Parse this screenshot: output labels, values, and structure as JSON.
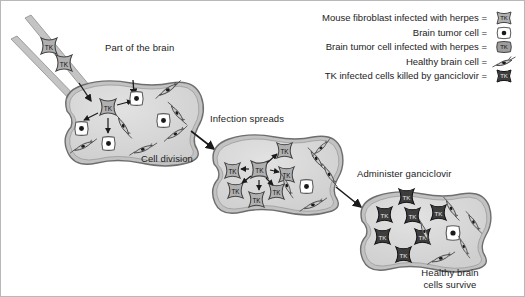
{
  "figure": {
    "background_color": "#ffffff",
    "border_color": "#b8b8b8"
  },
  "legend": {
    "items": [
      {
        "label": "Mouse fibroblast infected with herpes =",
        "icon": "tk-fibroblast-icon",
        "icon_type": "tk-star",
        "fill": "#b4b4b4",
        "text": "TK"
      },
      {
        "label": "Brain tumor cell =",
        "icon": "tumor-cell-icon",
        "icon_type": "tumor-blob",
        "fill": "#ffffff",
        "text": ""
      },
      {
        "label": "Brain tumor cell infected with herpes =",
        "icon": "tk-tumor-cell-icon",
        "icon_type": "tk-square",
        "fill": "#9a9a9a",
        "text": "TK"
      },
      {
        "label": "Healthy brain cell =",
        "icon": "healthy-neuron-icon",
        "icon_type": "neuron-spindle",
        "fill": "#c9c9c9",
        "text": ""
      },
      {
        "label": "TK infected cells killed by ganciclovir =",
        "icon": "killed-cell-icon",
        "icon_type": "tk-star-dark",
        "fill": "#3a3a3a",
        "text": "TK"
      }
    ]
  },
  "labels": {
    "part_of_brain": "Part of the brain",
    "cell_division": "Cell division",
    "infection_spreads": "Infection spreads",
    "administer_ganciclovir": "Administer ganciclovir",
    "healthy_brain_line1": "Healthy brain",
    "healthy_brain_line2": "cells survive"
  },
  "colors": {
    "brain_fill": "#d2d2d2",
    "brain_inner_fill": "#dcdcdc",
    "brain_outline": "#6e6e6e",
    "needle_fill": "#c4c4c4",
    "needle_outline": "#8a8a8a",
    "tk_cell_fill": "#b0b0b0",
    "tk_cell_outline": "#4a4a4a",
    "tumor_cell_fill": "#ffffff",
    "tumor_cell_outline": "#5a5a5a",
    "tumor_nucleus": "#1a1a1a",
    "neuron_fill": "#c9c9c9",
    "neuron_outline": "#4a4a4a",
    "killed_cell_fill": "#3d3d3d",
    "arrow_color": "#1a1a1a",
    "text_color": "#1c1c1c"
  },
  "stages": [
    {
      "name": "stage-1-injection",
      "caption": "Part of the brain",
      "sub_caption": "Cell division",
      "tk_cells_in_needle": 2,
      "tk_cells_in_brain": 1,
      "tumor_cells": 5,
      "healthy_cells": 7,
      "internal_arrows": 4
    },
    {
      "name": "stage-2-infection-spreads",
      "caption": "Infection spreads",
      "tk_cells": 6,
      "tumor_cells": 1,
      "healthy_cells": 7,
      "internal_arrows": 5
    },
    {
      "name": "stage-3-ganciclovir",
      "caption": "Administer ganciclovir",
      "bottom_caption": "Healthy brain cells survive",
      "killed_cells": 8,
      "tumor_cells": 1,
      "healthy_cells": 6
    }
  ],
  "flow_arrows": [
    {
      "name": "arrow-stage1-to-stage2",
      "from": "stage-1-injection",
      "to": "stage-2-infection-spreads"
    },
    {
      "name": "arrow-stage2-to-stage3",
      "from": "stage-2-infection-spreads",
      "to": "stage-3-ganciclovir"
    }
  ]
}
